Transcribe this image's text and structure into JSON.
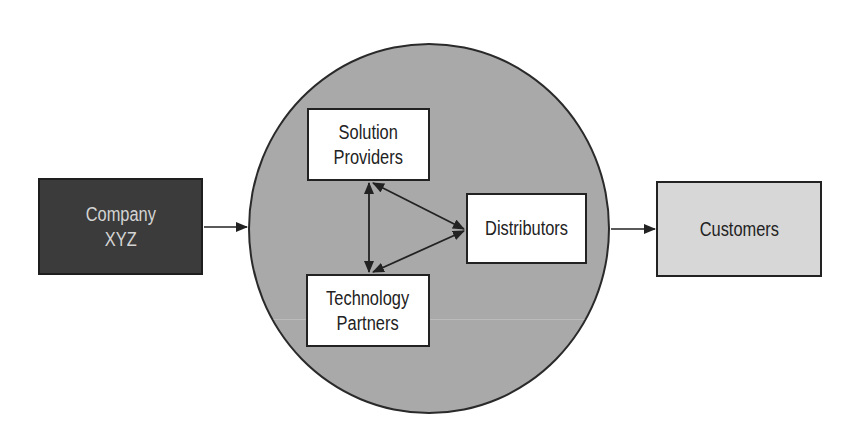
{
  "diagram": {
    "type": "flow",
    "nodes": {
      "company": {
        "label": "Company\nXYZ",
        "fill": "#3b3b3b",
        "text_color": "#d4d4d4"
      },
      "solution_providers": {
        "label": "Solution\nProviders",
        "fill": "#ffffff"
      },
      "technology_partners": {
        "label": "Technology\nPartners",
        "fill": "#ffffff"
      },
      "distributors": {
        "label": "Distributors",
        "fill": "#ffffff"
      },
      "customers": {
        "label": "Customers",
        "fill": "#d7d7d7"
      }
    },
    "hub": {
      "shape": "circle",
      "fill": "#a9a9a9",
      "contains": [
        "Solution Providers",
        "Technology Partners",
        "Distributors"
      ]
    },
    "edges": [
      {
        "from": "Company XYZ",
        "to": "Channel circle",
        "direction": "one-way"
      },
      {
        "from": "Solution Providers",
        "to": "Technology Partners",
        "direction": "two-way"
      },
      {
        "from": "Solution Providers",
        "to": "Distributors",
        "direction": "two-way"
      },
      {
        "from": "Technology Partners",
        "to": "Distributors",
        "direction": "two-way"
      },
      {
        "from": "Distributors",
        "to": "Customers",
        "direction": "one-way"
      }
    ]
  }
}
